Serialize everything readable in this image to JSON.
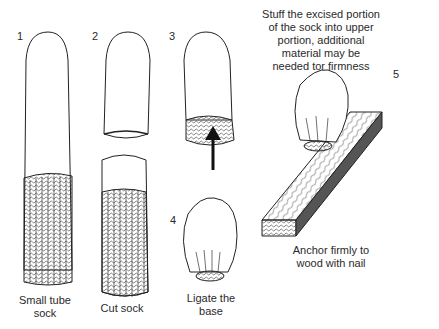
{
  "steps": [
    {
      "number": "1",
      "label_line1": "Small tube",
      "label_line2": "sock"
    },
    {
      "number": "2",
      "label_line1": "Cut sock",
      "label_line2": ""
    },
    {
      "number": "3",
      "label_line1": "",
      "label_line2": ""
    },
    {
      "number": "4",
      "label_line1": "Ligate the",
      "label_line2": "base"
    },
    {
      "number": "5",
      "label_line1": "Anchor firmly to",
      "label_line2": "wood with nail"
    }
  ],
  "instruction": {
    "line1": "Stuff the excised portion",
    "line2": "of the sock into upper",
    "line3": "portion, additional",
    "line4": "material may be",
    "line5": "needed tor firmness"
  },
  "colors": {
    "ink": "#2a2a2a",
    "background": "#ffffff"
  }
}
